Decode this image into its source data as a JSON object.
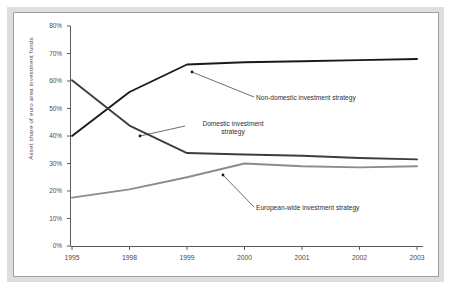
{
  "figure": {
    "background_color": "#ffffff",
    "frame_color": "#dededd",
    "border_color": "#9f9f9f"
  },
  "chart_data": {
    "type": "line",
    "title": "",
    "xlabel": "",
    "ylabel": "Asset share of euro area investment funds",
    "categories": [
      "1995",
      "1998",
      "1999",
      "2000",
      "2001",
      "2002",
      "2003"
    ],
    "ylim": [
      0,
      80
    ],
    "ytick_labels": [
      "0%",
      "10%",
      "20%",
      "30%",
      "40%",
      "50%",
      "60%",
      "70%",
      "80%"
    ],
    "ytick_values": [
      0,
      10,
      20,
      30,
      40,
      50,
      60,
      70,
      80
    ],
    "grid": false,
    "legend_position": "inline-annotations",
    "series": [
      {
        "name": "Non-domestic investment strategy",
        "color": "#1a1a1a",
        "values": [
          40.0,
          56.0,
          66.0,
          66.8,
          67.2,
          67.6,
          68.0
        ]
      },
      {
        "name": "Domestic investment strategy",
        "color": "#3d3d3d",
        "values": [
          60.3,
          43.8,
          33.8,
          33.3,
          32.8,
          32.0,
          31.5
        ]
      },
      {
        "name": "European-wide investment strategy",
        "color": "#8c8c8c",
        "values": [
          17.6,
          20.6,
          25.0,
          30.0,
          29.0,
          28.6,
          29.0
        ]
      }
    ],
    "annotations": [
      {
        "label": "Non-domestic investment strategy",
        "lines": [
          "Non-domestic investment strategy"
        ],
        "points_to_series": "Non-domestic investment strategy",
        "points_to_category": "1999"
      },
      {
        "label": "Domestic investment strategy",
        "lines": [
          "Domestic investment",
          "strategy"
        ],
        "points_to_series": "Domestic investment strategy",
        "points_to_category": "1998-1999"
      },
      {
        "label": "European-wide investment strategy",
        "lines": [
          "European-wide investment strategy"
        ],
        "points_to_series": "European-wide investment strategy",
        "points_to_category": "1999-2000"
      }
    ]
  }
}
